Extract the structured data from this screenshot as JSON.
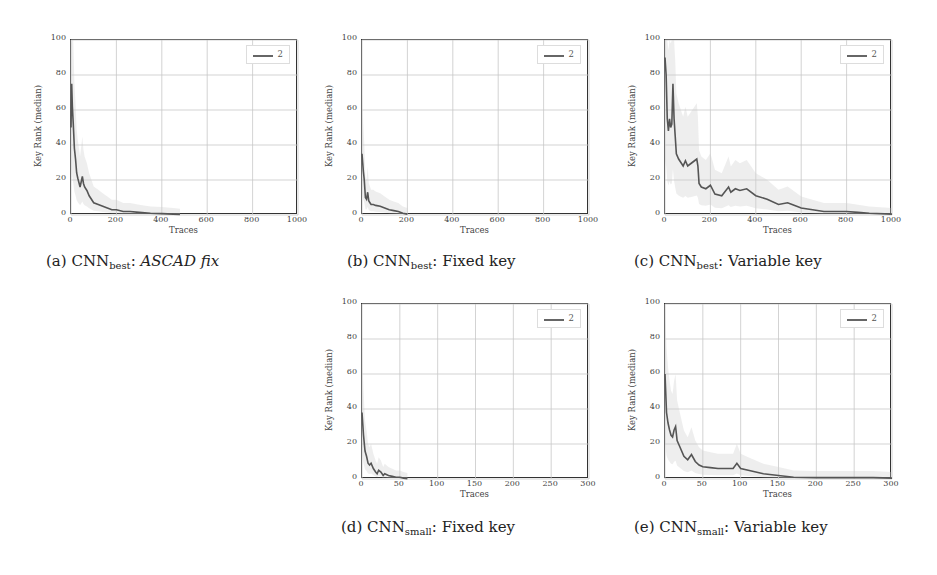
{
  "figure": {
    "panels": [
      {
        "id": "a",
        "caption_prefix": "(a) CNN",
        "caption_sub": "best",
        "caption_sep": ": ",
        "caption_text": "ASCAD fix",
        "caption_italic": true
      },
      {
        "id": "b",
        "caption_prefix": "(b) CNN",
        "caption_sub": "best",
        "caption_sep": ": ",
        "caption_text": "Fixed key",
        "caption_italic": false
      },
      {
        "id": "c",
        "caption_prefix": "(c) CNN",
        "caption_sub": "best",
        "caption_sep": ": ",
        "caption_text": "Variable key",
        "caption_italic": false
      },
      {
        "id": "d",
        "caption_prefix": "(d) CNN",
        "caption_sub": "small",
        "caption_sep": ": ",
        "caption_text": "Fixed key",
        "caption_italic": false
      },
      {
        "id": "e",
        "caption_prefix": "(e) CNN",
        "caption_sub": "small",
        "caption_sep": ": ",
        "caption_text": "Variable key",
        "caption_italic": false
      }
    ]
  },
  "colors": {
    "line": "#555555",
    "band": "#cfcfcf",
    "grid": "#c8c8c8",
    "frame": "#333333"
  },
  "chart_data": [
    {
      "type": "line",
      "title": "(a) CNN_best: ASCAD fix",
      "xlabel": "Traces",
      "ylabel": "Key Rank (median)",
      "xlim": [
        0,
        1000
      ],
      "ylim": [
        0,
        100
      ],
      "xticks": [
        0,
        200,
        400,
        600,
        800,
        1000
      ],
      "yticks": [
        0,
        20,
        40,
        60,
        80,
        100
      ],
      "grid": true,
      "legend": {
        "entries": [
          "2"
        ],
        "position": "upper right"
      },
      "series": [
        {
          "name": "2",
          "x": [
            0,
            3,
            6,
            10,
            15,
            20,
            25,
            30,
            40,
            50,
            55,
            60,
            70,
            80,
            90,
            100,
            120,
            140,
            160,
            180,
            200,
            230,
            260,
            300,
            350,
            400,
            450,
            480
          ],
          "y": [
            50,
            75,
            62,
            52,
            38,
            32,
            24,
            21,
            16,
            22,
            18,
            16,
            14,
            11,
            9,
            7,
            6,
            5,
            4,
            3,
            3,
            2,
            2,
            1.5,
            1,
            0.8,
            0.5,
            0.3
          ]
        }
      ]
    },
    {
      "type": "line",
      "title": "(b) CNN_best: Fixed key",
      "xlabel": "Traces",
      "ylabel": "Key Rank (median)",
      "xlim": [
        0,
        1000
      ],
      "ylim": [
        0,
        100
      ],
      "xticks": [
        0,
        200,
        400,
        600,
        800,
        1000
      ],
      "yticks": [
        0,
        20,
        40,
        60,
        80,
        100
      ],
      "grid": true,
      "legend": {
        "entries": [
          "2"
        ],
        "position": "upper right"
      },
      "series": [
        {
          "name": "2",
          "x": [
            0,
            3,
            6,
            10,
            15,
            20,
            25,
            30,
            35,
            40,
            50,
            60,
            80,
            100,
            120,
            140,
            160,
            180,
            200
          ],
          "y": [
            35,
            30,
            25,
            20,
            10,
            9,
            13,
            8,
            7,
            6,
            6,
            5.5,
            5,
            4,
            3,
            2.5,
            2,
            1,
            0.5
          ]
        }
      ]
    },
    {
      "type": "line",
      "title": "(c) CNN_best: Variable key",
      "xlabel": "Traces",
      "ylabel": "Key Rank (median)",
      "xlim": [
        0,
        1000
      ],
      "ylim": [
        0,
        100
      ],
      "xticks": [
        0,
        200,
        400,
        600,
        800,
        1000
      ],
      "yticks": [
        0,
        20,
        40,
        60,
        80,
        100
      ],
      "grid": true,
      "legend": {
        "entries": [
          "2"
        ],
        "position": "upper right"
      },
      "series": [
        {
          "name": "2",
          "x": [
            0,
            5,
            10,
            15,
            20,
            25,
            30,
            35,
            40,
            45,
            50,
            60,
            70,
            80,
            90,
            100,
            120,
            140,
            145,
            150,
            160,
            180,
            200,
            220,
            250,
            280,
            290,
            310,
            330,
            360,
            400,
            450,
            500,
            540,
            560,
            600,
            650,
            700,
            750,
            800,
            850,
            900,
            1000
          ],
          "y": [
            90,
            80,
            55,
            48,
            55,
            50,
            52,
            75,
            55,
            45,
            35,
            32,
            30,
            28,
            31,
            28,
            30,
            32,
            28,
            18,
            16,
            15,
            17,
            12,
            11,
            16,
            13,
            15,
            14,
            15,
            11,
            9,
            6,
            7,
            6,
            4,
            3,
            2,
            2,
            2,
            1.5,
            1,
            0.5
          ]
        }
      ]
    },
    {
      "type": "line",
      "title": "(d) CNN_small: Fixed key",
      "xlabel": "Traces",
      "ylabel": "Key Rank (median)",
      "xlim": [
        0,
        300
      ],
      "ylim": [
        0,
        100
      ],
      "xticks": [
        0,
        50,
        100,
        150,
        200,
        250,
        300
      ],
      "yticks": [
        0,
        20,
        40,
        60,
        80,
        100
      ],
      "grid": true,
      "legend": {
        "entries": [
          "2"
        ],
        "position": "upper right"
      },
      "series": [
        {
          "name": "2",
          "x": [
            0,
            2,
            4,
            6,
            8,
            10,
            12,
            15,
            18,
            20,
            22,
            25,
            28,
            30,
            35,
            40,
            45,
            50,
            55,
            60
          ],
          "y": [
            38,
            25,
            16,
            13,
            9,
            8,
            9,
            6,
            4,
            3,
            5,
            4,
            2,
            3,
            2,
            1.5,
            1,
            1,
            0.5,
            0.2
          ]
        }
      ]
    },
    {
      "type": "line",
      "title": "(e) CNN_small: Variable key",
      "xlabel": "Traces",
      "ylabel": "Key Rank (median)",
      "xlim": [
        0,
        300
      ],
      "ylim": [
        0,
        100
      ],
      "xticks": [
        0,
        50,
        100,
        150,
        200,
        250,
        300
      ],
      "yticks": [
        0,
        20,
        40,
        60,
        80,
        100
      ],
      "grid": true,
      "legend": {
        "entries": [
          "2"
        ],
        "position": "upper right"
      },
      "series": [
        {
          "name": "2",
          "x": [
            0,
            2,
            4,
            6,
            8,
            10,
            12,
            14,
            16,
            18,
            20,
            25,
            30,
            35,
            40,
            45,
            50,
            60,
            70,
            80,
            90,
            95,
            100,
            110,
            120,
            130,
            150,
            170,
            200,
            250,
            275,
            300
          ],
          "y": [
            60,
            38,
            32,
            28,
            25,
            24,
            28,
            30,
            22,
            20,
            18,
            13,
            11,
            14,
            10,
            8,
            7,
            6.5,
            6,
            6,
            6,
            9,
            6,
            5,
            4,
            3,
            2,
            1,
            0.8,
            0.8,
            0.8,
            0.5
          ]
        }
      ]
    }
  ]
}
